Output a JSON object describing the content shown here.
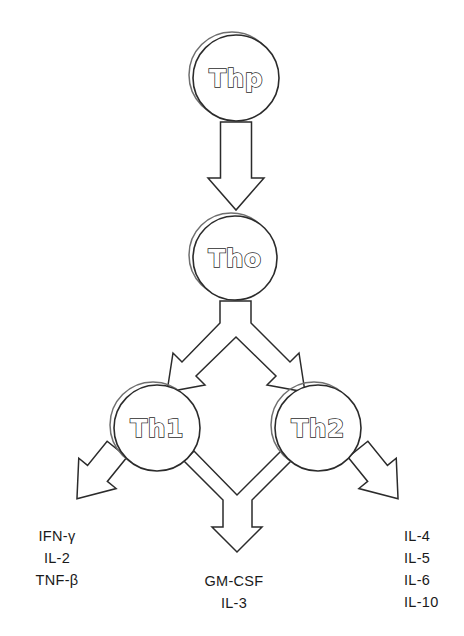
{
  "diagram": {
    "type": "flow-diagram",
    "background_color": "#ffffff",
    "stroke_color": "#2b2b2b",
    "nodes": [
      {
        "id": "thp",
        "label": "Thp",
        "cx": 236,
        "cy": 78,
        "r": 43
      },
      {
        "id": "tho",
        "label": "Tho",
        "cx": 235,
        "cy": 258,
        "r": 42
      },
      {
        "id": "th1",
        "label": "Th1",
        "cx": 157,
        "cy": 428,
        "r": 43
      },
      {
        "id": "th2",
        "label": "Th2",
        "cx": 318,
        "cy": 428,
        "r": 43
      }
    ],
    "groups": {
      "th1_cytokines": {
        "lines": [
          "IFN-γ",
          "IL-2",
          "TNF-β"
        ],
        "align": "center"
      },
      "shared_cytokines": {
        "lines": [
          "GM-CSF",
          "IL-3"
        ],
        "align": "center"
      },
      "th2_cytokines": {
        "lines": [
          "IL-4",
          "IL-5",
          "IL-6",
          "IL-10"
        ],
        "align": "start"
      }
    },
    "arrows": [
      {
        "id": "thp-to-tho",
        "icon": "down-arrow-icon"
      },
      {
        "id": "tho-branch",
        "icon": "branching-arrow-icon"
      },
      {
        "id": "th1-to-left",
        "icon": "diagonal-down-left-arrow-icon"
      },
      {
        "id": "th2-to-right",
        "icon": "diagonal-down-right-arrow-icon"
      },
      {
        "id": "merge-to-shared",
        "icon": "merging-arrow-icon"
      }
    ]
  }
}
